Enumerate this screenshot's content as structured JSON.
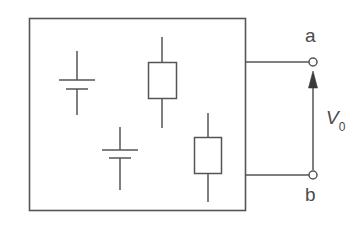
{
  "figure": {
    "background_color": "#ffffff",
    "stroke_color": "#555555",
    "text_color": "#4a4a4a",
    "width": 359,
    "height": 237
  },
  "network_box": {
    "name": "black-box-network",
    "x": 29,
    "y": 18,
    "width": 217,
    "height": 193
  },
  "components": [
    {
      "id": "battery-1",
      "type": "battery",
      "center_x": 77,
      "lead_top_y": 51,
      "lead_bottom_y": 115,
      "long_plate_y": 80,
      "long_plate_half_width": 18,
      "short_plate_y": 89,
      "short_plate_half_width": 11
    },
    {
      "id": "battery-2",
      "type": "battery",
      "center_x": 120,
      "lead_top_y": 127,
      "lead_bottom_y": 190,
      "long_plate_y": 150,
      "long_plate_half_width": 18,
      "short_plate_y": 158,
      "short_plate_half_width": 11
    },
    {
      "id": "resistor-1",
      "type": "resistor",
      "center_x": 162,
      "box_x": 148,
      "box_y": 62,
      "box_width": 29,
      "box_height": 37,
      "lead_top_y": 37,
      "lead_bottom_y": 128
    },
    {
      "id": "resistor-2",
      "type": "resistor",
      "center_x": 208,
      "box_x": 194,
      "box_y": 137,
      "box_width": 28,
      "box_height": 37,
      "lead_top_y": 113,
      "lead_bottom_y": 202
    }
  ],
  "terminals": {
    "top": {
      "label": "a",
      "node_x": 313,
      "node_y": 62,
      "node_radius": 4,
      "lead_from_x": 246
    },
    "bottom": {
      "label": "b",
      "node_x": 313,
      "node_y": 175,
      "node_radius": 4,
      "lead_from_x": 246
    }
  },
  "voltage_arrow": {
    "label": "V",
    "subscript": "0",
    "full_label": "V0",
    "x": 313,
    "tail_y": 170,
    "head_y": 72,
    "head_width": 9,
    "head_length": 16,
    "direction": "up"
  }
}
